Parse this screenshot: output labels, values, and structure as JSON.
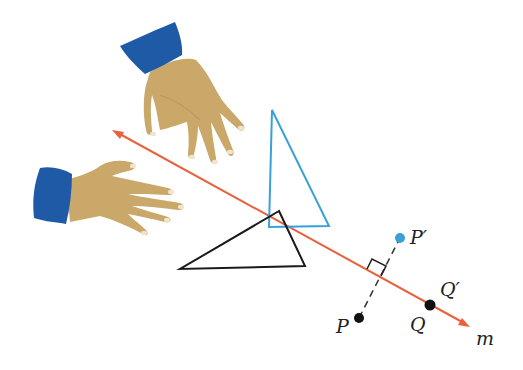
{
  "figure": {
    "colors": {
      "line_m": "#e8603c",
      "image_triangle": "#3aa0d8",
      "preimage_triangle": "#1a1a1a",
      "point_image": "#3aa0d8",
      "point_preimage": "#111111",
      "skin": "#c9a86a",
      "skin_shadow": "#b8955a",
      "nail": "#f0e4cc",
      "cuff": "#1f5aa6"
    },
    "line": {
      "label": "m"
    },
    "points": {
      "P": {
        "label": "P"
      },
      "P_prime": {
        "label": "P′"
      },
      "Q": {
        "label": "Q"
      },
      "Q_prime": {
        "label": "Q′"
      }
    },
    "shapes": {
      "preimage_triangle": "black triangle",
      "image_triangle": "blue triangle"
    },
    "illustrations": [
      "upper-hand",
      "left-hand"
    ]
  }
}
